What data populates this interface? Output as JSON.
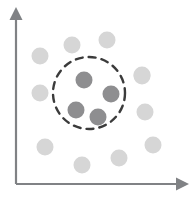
{
  "figure": {
    "background_color": "#ffffff"
  },
  "axes": {
    "x_axis": {
      "name": "x-axis",
      "color": "#808285",
      "stroke_width": 2.2,
      "x1": 16,
      "y1": 184,
      "x2": 178,
      "y2": 184,
      "arrow": "right",
      "label": ""
    },
    "y_axis": {
      "name": "y-axis",
      "color": "#808285",
      "stroke_width": 2.2,
      "x1": 16,
      "y1": 184,
      "x2": 16,
      "y2": 18,
      "arrow": "up",
      "label": ""
    }
  },
  "annotation": {
    "dashed_circle": {
      "label": "cluster-boundary",
      "cx": 89,
      "cy": 93,
      "r": 36,
      "color": "#3b3b3b",
      "stroke_width": 2.4,
      "dash": "7 6",
      "fill": "none"
    }
  },
  "chart_data": {
    "type": "scatter",
    "title": "",
    "xlabel": "",
    "ylabel": "",
    "xlim": [
      0,
      192
    ],
    "ylim": [
      0,
      197
    ],
    "grid": false,
    "legend": false,
    "point_radius": 8.5,
    "colors": {
      "cluster": "#8e8e90",
      "outlier": "#d6d6d6",
      "axis": "#808285",
      "circle": "#3b3b3b"
    },
    "series": [
      {
        "name": "cluster",
        "label": "Clustered points (inside dashed circle)",
        "color": "#8e8e90",
        "radius": 8.5,
        "count": 4,
        "points": [
          {
            "x": 84,
            "y": 80
          },
          {
            "x": 111,
            "y": 94
          },
          {
            "x": 76,
            "y": 110
          },
          {
            "x": 98,
            "y": 117
          }
        ]
      },
      {
        "name": "outliers",
        "label": "Scattered points (outside dashed circle)",
        "color": "#d6d6d6",
        "radius": 8.5,
        "count": 11,
        "points": [
          {
            "x": 40,
            "y": 56
          },
          {
            "x": 72,
            "y": 45
          },
          {
            "x": 107,
            "y": 40
          },
          {
            "x": 142,
            "y": 75
          },
          {
            "x": 40,
            "y": 93
          },
          {
            "x": 145,
            "y": 112
          },
          {
            "x": 45,
            "y": 147
          },
          {
            "x": 153,
            "y": 145
          },
          {
            "x": 119,
            "y": 158
          },
          {
            "x": 82,
            "y": 165
          },
          {
            "x": 142,
            "y": 76
          }
        ]
      }
    ]
  }
}
